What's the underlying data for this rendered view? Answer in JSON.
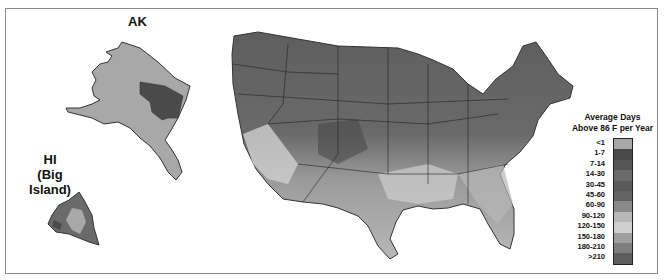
{
  "figure": {
    "labels": {
      "alaska": "AK",
      "hawaii_line1": "HI",
      "hawaii_line2": "(Big Island)"
    },
    "legend": {
      "title_line1": "Average Days",
      "title_line2": "Above 86 F per Year",
      "items": [
        {
          "label": "<1",
          "color": "#a8a8a8"
        },
        {
          "label": "1-7",
          "color": "#4a4a4a"
        },
        {
          "label": "7-14",
          "color": "#555555"
        },
        {
          "label": "14-30",
          "color": "#6a6a6a"
        },
        {
          "label": "30-45",
          "color": "#5a5a5a"
        },
        {
          "label": "45-60",
          "color": "#626262"
        },
        {
          "label": "60-90",
          "color": "#8a8a8a"
        },
        {
          "label": "90-120",
          "color": "#b8b8b8"
        },
        {
          "label": "120-150",
          "color": "#cfcfcf"
        },
        {
          "label": "150-180",
          "color": "#a0a0a0"
        },
        {
          "label": "180-210",
          "color": "#7e7e7e"
        },
        {
          "label": ">210",
          "color": "#5e5e5e"
        }
      ]
    }
  }
}
